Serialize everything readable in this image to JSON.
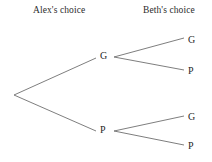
{
  "figure": {
    "type": "game-tree",
    "background_color": "#ffffff",
    "line_color": "#6f6f6f",
    "text_color": "#1f1f1f"
  },
  "headers": {
    "left": "Alex's choice",
    "right": "Beth's choice"
  },
  "nodes": {
    "root": {
      "label": "",
      "x": 14,
      "y": 95
    },
    "alex_g": {
      "label": "G",
      "x": 103,
      "y": 57
    },
    "alex_p": {
      "label": "P",
      "x": 103,
      "y": 131
    }
  },
  "leaves": [
    {
      "label": "G",
      "parent": "alex_g",
      "x": 190,
      "y": 41
    },
    {
      "label": "P",
      "parent": "alex_g",
      "x": 190,
      "y": 72
    },
    {
      "label": "G",
      "parent": "alex_p",
      "x": 190,
      "y": 118
    },
    {
      "label": "P",
      "parent": "alex_p",
      "x": 190,
      "y": 147
    }
  ],
  "edges": [
    {
      "name": "root-to-alex-g",
      "x1": 14,
      "y1": 95,
      "x2": 96,
      "y2": 58
    },
    {
      "name": "root-to-alex-p",
      "x1": 14,
      "y1": 95,
      "x2": 96,
      "y2": 131
    },
    {
      "name": "alex-g-to-leaf-g",
      "x1": 114,
      "y1": 57,
      "x2": 184,
      "y2": 38
    },
    {
      "name": "alex-g-to-leaf-p",
      "x1": 114,
      "y1": 57,
      "x2": 184,
      "y2": 70
    },
    {
      "name": "alex-p-to-leaf-g",
      "x1": 114,
      "y1": 131,
      "x2": 184,
      "y2": 116
    },
    {
      "name": "alex-p-to-leaf-p",
      "x1": 114,
      "y1": 131,
      "x2": 184,
      "y2": 145
    }
  ]
}
